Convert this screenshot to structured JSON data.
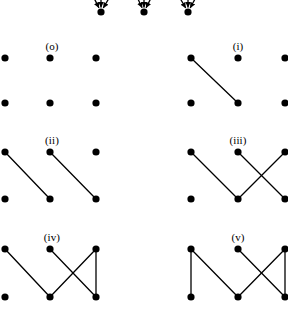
{
  "figure": {
    "width": 288,
    "height": 323,
    "background_color": "#ffffff",
    "ink_color": "#000000",
    "node_radius": 3.6,
    "edge_width": 1.3
  },
  "top_fragment": {
    "name": "cropped-arrow-row",
    "visible": true,
    "vertices": [
      {
        "x": 101,
        "y": 12
      },
      {
        "x": 144,
        "y": 12
      },
      {
        "x": 188,
        "y": 12
      }
    ],
    "arrows": [
      {
        "x1": 88,
        "y1": -14,
        "x2": 101,
        "y2": 12
      },
      {
        "x1": 101,
        "y1": -14,
        "x2": 101,
        "y2": 12
      },
      {
        "x1": 116,
        "y1": -14,
        "x2": 101,
        "y2": 12
      },
      {
        "x1": 132,
        "y1": -14,
        "x2": 144,
        "y2": 12
      },
      {
        "x1": 144,
        "y1": -14,
        "x2": 144,
        "y2": 12
      },
      {
        "x1": 157,
        "y1": -14,
        "x2": 144,
        "y2": 12
      },
      {
        "x1": 173,
        "y1": -14,
        "x2": 188,
        "y2": 12
      },
      {
        "x1": 188,
        "y1": -14,
        "x2": 188,
        "y2": 12
      },
      {
        "x1": 202,
        "y1": -14,
        "x2": 188,
        "y2": 12
      }
    ]
  },
  "panels": [
    {
      "id": "o",
      "label": "(o)",
      "label_x": 52,
      "label_y": 41,
      "edge_count": 0,
      "nodes": [
        {
          "id": "tl",
          "x": 5,
          "y": 58
        },
        {
          "id": "tm",
          "x": 50,
          "y": 58
        },
        {
          "id": "tr",
          "x": 96,
          "y": 58
        },
        {
          "id": "bl",
          "x": 5,
          "y": 103
        },
        {
          "id": "bm",
          "x": 50,
          "y": 103
        },
        {
          "id": "br",
          "x": 96,
          "y": 103
        }
      ],
      "edges": []
    },
    {
      "id": "i",
      "label": "(i)",
      "label_x": 238,
      "label_y": 41,
      "edge_count": 1,
      "nodes": [
        {
          "id": "tl",
          "x": 191,
          "y": 58
        },
        {
          "id": "tm",
          "x": 238,
          "y": 58
        },
        {
          "id": "tr",
          "x": 285,
          "y": 58
        },
        {
          "id": "bl",
          "x": 191,
          "y": 103
        },
        {
          "id": "bm",
          "x": 238,
          "y": 103
        },
        {
          "id": "br",
          "x": 285,
          "y": 103
        }
      ],
      "edges": [
        {
          "from": "tl",
          "to": "bm"
        }
      ]
    },
    {
      "id": "ii",
      "label": "(ii)",
      "label_x": 52,
      "label_y": 135,
      "edge_count": 2,
      "nodes": [
        {
          "id": "tl",
          "x": 5,
          "y": 152
        },
        {
          "id": "tm",
          "x": 50,
          "y": 152
        },
        {
          "id": "tr",
          "x": 96,
          "y": 152
        },
        {
          "id": "bl",
          "x": 5,
          "y": 199
        },
        {
          "id": "bm",
          "x": 50,
          "y": 199
        },
        {
          "id": "br",
          "x": 96,
          "y": 199
        }
      ],
      "edges": [
        {
          "from": "tl",
          "to": "bm"
        },
        {
          "from": "tm",
          "to": "br"
        }
      ]
    },
    {
      "id": "iii",
      "label": "(iii)",
      "label_x": 238,
      "label_y": 135,
      "edge_count": 3,
      "nodes": [
        {
          "id": "tl",
          "x": 191,
          "y": 152
        },
        {
          "id": "tm",
          "x": 238,
          "y": 152
        },
        {
          "id": "tr",
          "x": 285,
          "y": 152
        },
        {
          "id": "bl",
          "x": 191,
          "y": 199
        },
        {
          "id": "bm",
          "x": 238,
          "y": 199
        },
        {
          "id": "br",
          "x": 285,
          "y": 199
        }
      ],
      "edges": [
        {
          "from": "tl",
          "to": "bm"
        },
        {
          "from": "tm",
          "to": "br"
        },
        {
          "from": "bm",
          "to": "tr"
        }
      ]
    },
    {
      "id": "iv",
      "label": "(iv)",
      "label_x": 52,
      "label_y": 232,
      "edge_count": 4,
      "nodes": [
        {
          "id": "tl",
          "x": 5,
          "y": 249
        },
        {
          "id": "tm",
          "x": 50,
          "y": 249
        },
        {
          "id": "tr",
          "x": 96,
          "y": 249
        },
        {
          "id": "bl",
          "x": 5,
          "y": 297
        },
        {
          "id": "bm",
          "x": 50,
          "y": 297
        },
        {
          "id": "br",
          "x": 96,
          "y": 297
        }
      ],
      "edges": [
        {
          "from": "tl",
          "to": "bm"
        },
        {
          "from": "tm",
          "to": "br"
        },
        {
          "from": "bm",
          "to": "tr"
        },
        {
          "from": "tr",
          "to": "br"
        }
      ]
    },
    {
      "id": "v",
      "label": "(v)",
      "label_x": 238,
      "label_y": 232,
      "edge_count": 5,
      "nodes": [
        {
          "id": "tl",
          "x": 191,
          "y": 249
        },
        {
          "id": "tm",
          "x": 238,
          "y": 249
        },
        {
          "id": "tr",
          "x": 285,
          "y": 249
        },
        {
          "id": "bl",
          "x": 191,
          "y": 297
        },
        {
          "id": "bm",
          "x": 238,
          "y": 297
        },
        {
          "id": "br",
          "x": 285,
          "y": 297
        }
      ],
      "edges": [
        {
          "from": "tl",
          "to": "bm"
        },
        {
          "from": "tm",
          "to": "br"
        },
        {
          "from": "bm",
          "to": "tr"
        },
        {
          "from": "tr",
          "to": "br"
        },
        {
          "from": "tl",
          "to": "bl"
        }
      ]
    }
  ]
}
